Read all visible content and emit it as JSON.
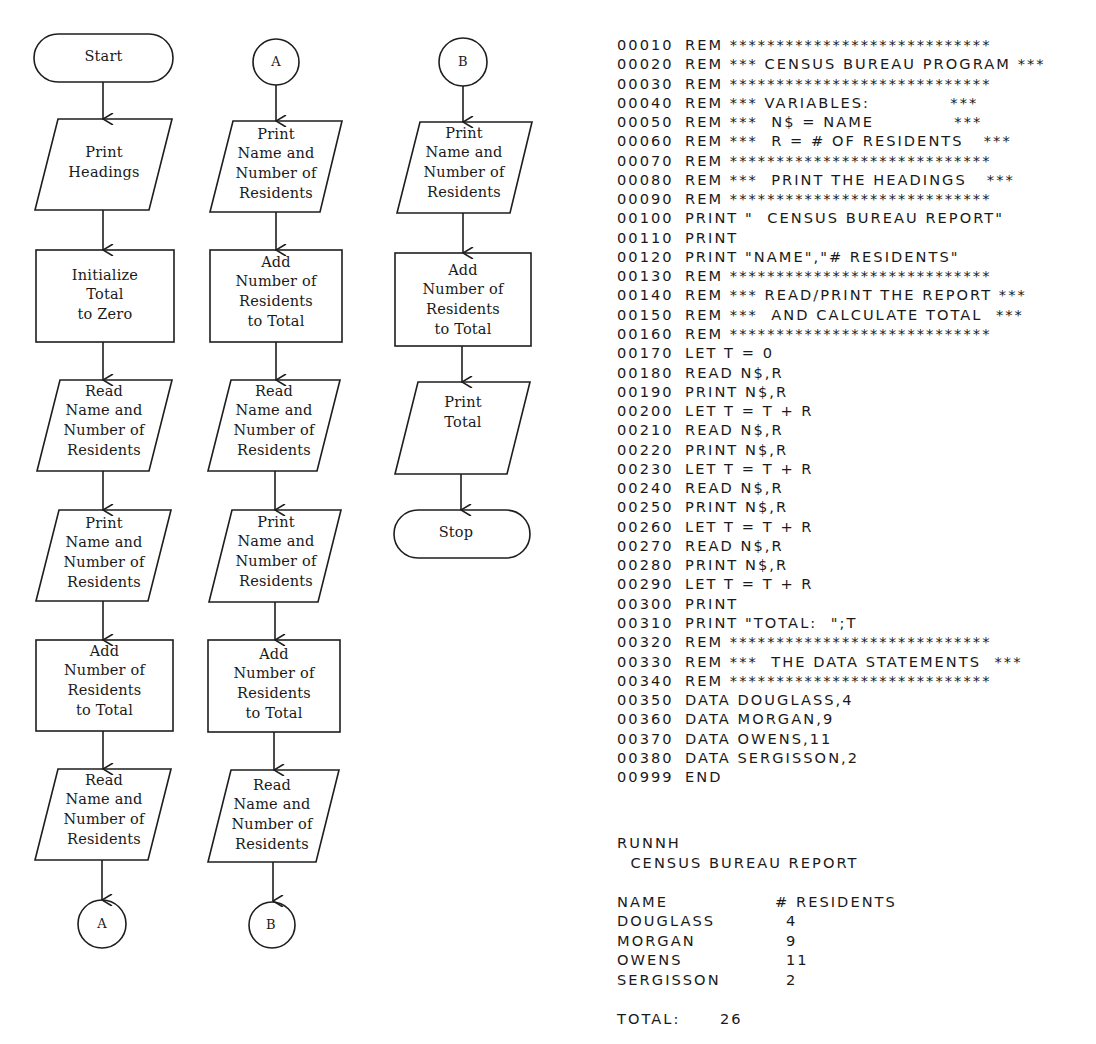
{
  "flowchart": {
    "columns": [
      {
        "id": "main",
        "nodes": [
          {
            "type": "terminator",
            "label": "Start"
          },
          {
            "type": "io",
            "label": "Print\nHeadings"
          },
          {
            "type": "process",
            "label": "Initialize\nTotal\nto Zero"
          },
          {
            "type": "io",
            "label": "Read\nName and\nNumber of\nResidents"
          },
          {
            "type": "io",
            "label": "Print\nName and\nNumber of\nResidents"
          },
          {
            "type": "process",
            "label": "Add\nNumber of\nResidents\nto Total"
          },
          {
            "type": "io",
            "label": "Read\nName and\nNumber of\nResidents"
          },
          {
            "type": "connector",
            "label": "A"
          }
        ]
      },
      {
        "id": "A",
        "nodes": [
          {
            "type": "connector",
            "label": "A"
          },
          {
            "type": "io",
            "label": "Print\nName and\nNumber of\nResidents"
          },
          {
            "type": "process",
            "label": "Add\nNumber of\nResidents\nto Total"
          },
          {
            "type": "io",
            "label": "Read\nName and\nNumber of\nResidents"
          },
          {
            "type": "io",
            "label": "Print\nName and\nNumber of\nResidents"
          },
          {
            "type": "process",
            "label": "Add\nNumber of\nResidents\nto Total"
          },
          {
            "type": "io",
            "label": "Read\nName and\nNumber of\nResidents"
          },
          {
            "type": "connector",
            "label": "B"
          }
        ]
      },
      {
        "id": "B",
        "nodes": [
          {
            "type": "connector",
            "label": "B"
          },
          {
            "type": "io",
            "label": "Print\nName and\nNumber of\nResidents"
          },
          {
            "type": "process",
            "label": "Add\nNumber of\nResidents\nto Total"
          },
          {
            "type": "io",
            "label": "Print\nTotal"
          },
          {
            "type": "terminator",
            "label": "Stop"
          }
        ]
      }
    ]
  },
  "listing": {
    "lines": [
      {
        "ln": "00010",
        "stmt": "REM ****************************"
      },
      {
        "ln": "00020",
        "stmt": "REM *** CENSUS BUREAU PROGRAM ***"
      },
      {
        "ln": "00030",
        "stmt": "REM ****************************"
      },
      {
        "ln": "00040",
        "stmt": "REM *** VARIABLES:            ***"
      },
      {
        "ln": "00050",
        "stmt": "REM ***  N$ = NAME            ***"
      },
      {
        "ln": "00060",
        "stmt": "REM ***  R = # OF RESIDENTS   ***"
      },
      {
        "ln": "00070",
        "stmt": "REM ****************************"
      },
      {
        "ln": "00080",
        "stmt": "REM ***  PRINT THE HEADINGS   ***"
      },
      {
        "ln": "00090",
        "stmt": "REM ****************************"
      },
      {
        "ln": "00100",
        "stmt": "PRINT \"  CENSUS BUREAU REPORT\""
      },
      {
        "ln": "00110",
        "stmt": "PRINT"
      },
      {
        "ln": "00120",
        "stmt": "PRINT \"NAME\",\"# RESIDENTS\""
      },
      {
        "ln": "00130",
        "stmt": "REM ****************************"
      },
      {
        "ln": "00140",
        "stmt": "REM *** READ/PRINT THE REPORT ***"
      },
      {
        "ln": "00150",
        "stmt": "REM ***  AND CALCULATE TOTAL  ***"
      },
      {
        "ln": "00160",
        "stmt": "REM ****************************"
      },
      {
        "ln": "00170",
        "stmt": "LET T = 0"
      },
      {
        "ln": "00180",
        "stmt": "READ N$,R"
      },
      {
        "ln": "00190",
        "stmt": "PRINT N$,R"
      },
      {
        "ln": "00200",
        "stmt": "LET T = T + R"
      },
      {
        "ln": "00210",
        "stmt": "READ N$,R"
      },
      {
        "ln": "00220",
        "stmt": "PRINT N$,R"
      },
      {
        "ln": "00230",
        "stmt": "LET T = T + R"
      },
      {
        "ln": "00240",
        "stmt": "READ N$,R"
      },
      {
        "ln": "00250",
        "stmt": "PRINT N$,R"
      },
      {
        "ln": "00260",
        "stmt": "LET T = T + R"
      },
      {
        "ln": "00270",
        "stmt": "READ N$,R"
      },
      {
        "ln": "00280",
        "stmt": "PRINT N$,R"
      },
      {
        "ln": "00290",
        "stmt": "LET T = T + R"
      },
      {
        "ln": "00300",
        "stmt": "PRINT"
      },
      {
        "ln": "00310",
        "stmt": "PRINT \"TOTAL:  \";T"
      },
      {
        "ln": "00320",
        "stmt": "REM ****************************"
      },
      {
        "ln": "00330",
        "stmt": "REM ***  THE DATA STATEMENTS  ***"
      },
      {
        "ln": "00340",
        "stmt": "REM ****************************"
      },
      {
        "ln": "00350",
        "stmt": "DATA DOUGLASS,4"
      },
      {
        "ln": "00360",
        "stmt": "DATA MORGAN,9"
      },
      {
        "ln": "00370",
        "stmt": "DATA OWENS,11"
      },
      {
        "ln": "00380",
        "stmt": "DATA SERGISSON,2"
      },
      {
        "ln": "00999",
        "stmt": "END"
      }
    ]
  },
  "output": {
    "command": "RUNNH",
    "report_title": "  CENSUS BUREAU REPORT",
    "headers": [
      "NAME",
      "# RESIDENTS"
    ],
    "rows": [
      {
        "name": "DOUGLASS",
        "residents": "4"
      },
      {
        "name": "MORGAN",
        "residents": "9"
      },
      {
        "name": "OWENS",
        "residents": "11"
      },
      {
        "name": "SERGISSON",
        "residents": "2"
      }
    ],
    "total_label": "TOTAL:",
    "total_value": "26"
  }
}
